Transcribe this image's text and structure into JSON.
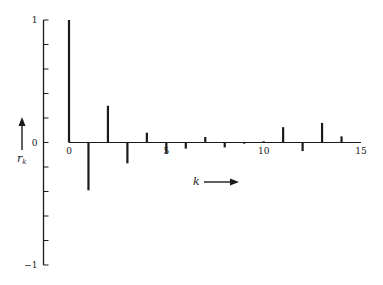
{
  "chart_data": {
    "type": "bar",
    "subtype": "stem",
    "title": "",
    "xlabel": "k",
    "ylabel": "r",
    "ylabel_subscript": "k",
    "x": [
      0,
      1,
      2,
      3,
      4,
      5,
      6,
      7,
      8,
      9,
      10,
      11,
      12,
      13,
      14
    ],
    "values": [
      1.0,
      -0.39,
      0.3,
      -0.17,
      0.08,
      -0.09,
      -0.05,
      0.045,
      -0.04,
      -0.01,
      0.01,
      0.125,
      -0.07,
      0.16,
      0.05
    ],
    "xlim": [
      0,
      15
    ],
    "ylim": [
      -1,
      1
    ],
    "x_ticks": [
      {
        "value": 0,
        "label": "0"
      },
      {
        "value": 5,
        "label": "5"
      },
      {
        "value": 10,
        "label": "10"
      },
      {
        "value": 15,
        "label": "15"
      }
    ],
    "y_ticks": [
      -1,
      -0.8,
      -0.6,
      -0.4,
      -0.2,
      0,
      0.2,
      0.4,
      0.6,
      0.8,
      1
    ],
    "y_tick_labels": [
      {
        "value": 1,
        "label": "1"
      },
      {
        "value": 0,
        "label": "0"
      },
      {
        "value": -1,
        "label": "−1"
      }
    ],
    "grid": false,
    "legend": "none",
    "color": "#1a1a1a"
  }
}
